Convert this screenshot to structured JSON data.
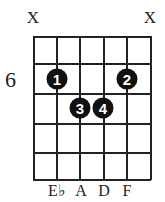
{
  "diagram": {
    "type": "guitar-chord",
    "start_fret_label": "6",
    "strings": 6,
    "frets_shown": 5,
    "muted_strings": [
      {
        "string": 1,
        "label": "X"
      },
      {
        "string": 6,
        "label": "X"
      }
    ],
    "fingers": [
      {
        "finger": "1",
        "string": 2,
        "fret_row": 1
      },
      {
        "finger": "2",
        "string": 5,
        "fret_row": 1
      },
      {
        "finger": "3",
        "string": 3,
        "fret_row": 2
      },
      {
        "finger": "4",
        "string": 4,
        "fret_row": 2
      }
    ],
    "notes": [
      {
        "string": 2,
        "label": "E♭"
      },
      {
        "string": 3,
        "label": "A"
      },
      {
        "string": 4,
        "label": "D"
      },
      {
        "string": 5,
        "label": "F"
      }
    ]
  }
}
